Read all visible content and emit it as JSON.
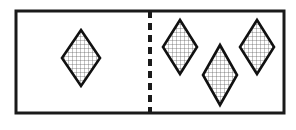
{
  "figure": {
    "kind": "partitioned-set-diagram",
    "background_color": "#ffffff",
    "frame": {
      "name": "outer-rectangle",
      "x": 16,
      "y": 11,
      "width": 268,
      "height": 102,
      "stroke_color": "#1a1a1a",
      "stroke_width": 3,
      "fill_color": "#ffffff"
    },
    "divider": {
      "name": "vertical-dashed-divider",
      "x": 150,
      "y_start": 11,
      "y_end": 113,
      "stroke_color": "#1a1a1a",
      "stroke_width": 4,
      "dash_length": 7,
      "gap_length": 5,
      "style": "dashed"
    },
    "cells": [
      {
        "name": "left-cell",
        "label": "left",
        "count": 1,
        "shapes": [
          {
            "name": "diamond-left-1",
            "cx": 81,
            "cy": 58,
            "rx": 19,
            "ry": 28
          }
        ]
      },
      {
        "name": "right-cell",
        "label": "right",
        "count": 3,
        "shapes": [
          {
            "name": "diamond-right-1",
            "cx": 180,
            "cy": 47,
            "rx": 17,
            "ry": 27
          },
          {
            "name": "diamond-right-2",
            "cx": 220,
            "cy": 75,
            "rx": 17,
            "ry": 30
          },
          {
            "name": "diamond-right-3",
            "cx": 257,
            "cy": 47,
            "rx": 17,
            "ry": 27
          }
        ]
      }
    ],
    "shape_style": {
      "name": "hatched-diamond",
      "outline_color": "#111111",
      "outline_width": 2.6,
      "fill_color": "#ffffff",
      "hatch_color": "#555555",
      "hatch_width": 0.7,
      "hatch_spacing": 4,
      "hatch_type": "grid"
    },
    "totals": {
      "left_count": 1,
      "right_count": 3,
      "total_count": 4
    }
  }
}
